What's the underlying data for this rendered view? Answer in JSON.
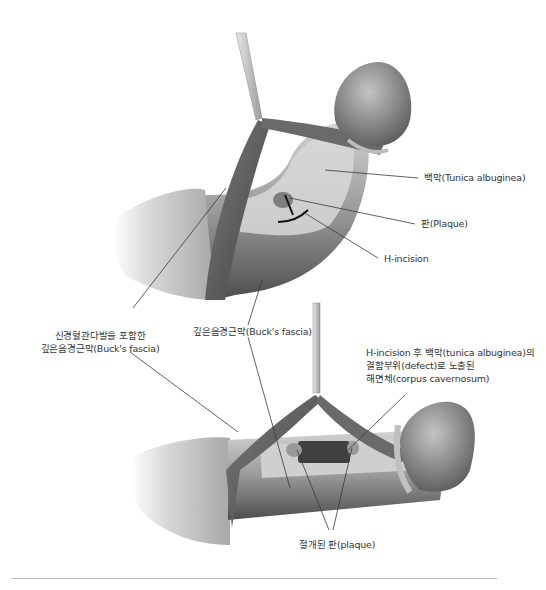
{
  "figure": {
    "top_panel": {
      "labels": {
        "tunica": "백막(Tunica albuginea)",
        "plaque": "판(Plaque)",
        "h_incision": "H-incision",
        "bucks_fascia": "깊은음경근막(Buck's fascia)"
      }
    },
    "shared_labels": {
      "nvb_line1": "신경혈관다발을 포함한",
      "nvb_line2": "깊은음경근막(Buck's fascia)"
    },
    "bottom_panel": {
      "labels": {
        "defect_line1": "H-incision 후 백막(tunica albuginea)의",
        "defect_line2": "결함부위(defect)로 노출된",
        "defect_line3": "해면체(corpus cavernosum)",
        "incised_plaque": "절개된 판(plaque)"
      }
    },
    "colors": {
      "background": "#ffffff",
      "leader_line": "#3a3a3a",
      "text": "#333333",
      "tissue_dark": "#5a5a5a",
      "tissue_mid": "#8c8c8c",
      "tissue_light": "#c8c8c8",
      "divider": "#b8b8b8"
    }
  }
}
